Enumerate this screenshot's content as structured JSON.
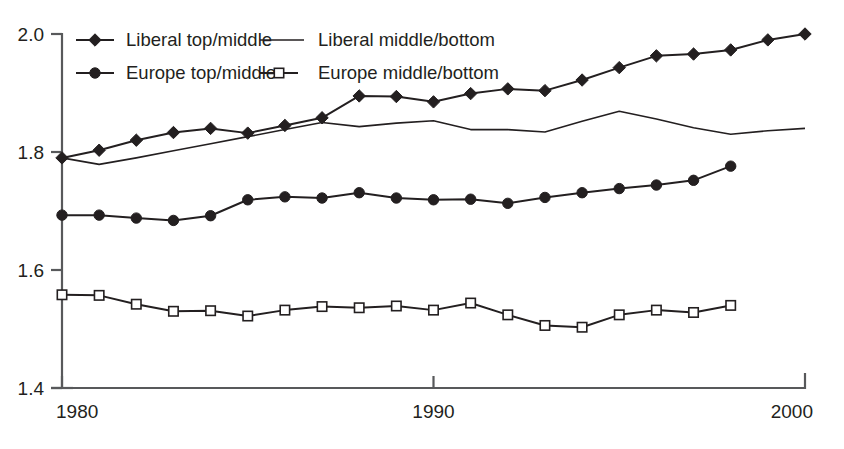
{
  "chart_data": {
    "type": "line",
    "title": "",
    "subtitle": "",
    "xlabel": "",
    "ylabel": "",
    "xlim": [
      1980,
      2000
    ],
    "ylim": [
      1.4,
      2.0
    ],
    "xticks": [
      1980,
      1990,
      2000
    ],
    "xticklabels": [
      "1980",
      "1990",
      "2000"
    ],
    "yticks": [
      1.4,
      1.6,
      1.8,
      2.0
    ],
    "yticklabels": [
      "1.4",
      "1.6",
      "1.8",
      "2.0"
    ],
    "grid": false,
    "legend_position": "top-left",
    "x": [
      1980,
      1981,
      1982,
      1983,
      1984,
      1985,
      1986,
      1987,
      1988,
      1989,
      1990,
      1991,
      1992,
      1993,
      1994,
      1995,
      1996,
      1997,
      1998,
      1999,
      2000
    ],
    "series": [
      {
        "name": "Liberal top/middle",
        "marker": "diamond",
        "line": "solid",
        "color": "#231f20",
        "x": [
          1980,
          1981,
          1982,
          1983,
          1984,
          1985,
          1986,
          1987,
          1988,
          1989,
          1990,
          1991,
          1992,
          1993,
          1994,
          1995,
          1996,
          1997,
          1998,
          1999,
          2000
        ],
        "values": [
          1.79,
          1.803,
          1.82,
          1.833,
          1.84,
          1.832,
          1.845,
          1.858,
          1.895,
          1.894,
          1.885,
          1.899,
          1.907,
          1.904,
          1.922,
          1.943,
          1.963,
          1.966,
          1.973,
          1.99,
          2.0
        ]
      },
      {
        "name": "Liberal middle/bottom",
        "marker": "none",
        "line": "solid",
        "color": "#231f20",
        "x": [
          1980,
          1981,
          1982,
          1983,
          1984,
          1985,
          1986,
          1987,
          1988,
          1989,
          1990,
          1991,
          1992,
          1993,
          1994,
          1995,
          1996,
          1997,
          1998,
          1999,
          2000
        ],
        "values": [
          1.79,
          1.779,
          1.79,
          1.802,
          1.814,
          1.826,
          1.838,
          1.85,
          1.843,
          1.849,
          1.853,
          1.838,
          1.838,
          1.834,
          1.852,
          1.869,
          1.856,
          1.841,
          1.83,
          1.836,
          1.84
        ]
      },
      {
        "name": "Europe top/middle",
        "marker": "circle",
        "line": "solid",
        "color": "#231f20",
        "x": [
          1980,
          1981,
          1982,
          1983,
          1984,
          1985,
          1986,
          1987,
          1988,
          1989,
          1990,
          1991,
          1992,
          1993,
          1994,
          1995,
          1996,
          1997,
          1998
        ],
        "values": [
          1.693,
          1.693,
          1.688,
          1.684,
          1.692,
          1.719,
          1.724,
          1.722,
          1.731,
          1.722,
          1.719,
          1.72,
          1.713,
          1.723,
          1.731,
          1.738,
          1.744,
          1.752,
          1.776
        ]
      },
      {
        "name": "Europe middle/bottom",
        "marker": "square",
        "line": "solid",
        "color": "#231f20",
        "x": [
          1980,
          1981,
          1982,
          1983,
          1984,
          1985,
          1986,
          1987,
          1988,
          1989,
          1990,
          1991,
          1992,
          1993,
          1994,
          1995,
          1996,
          1997,
          1998
        ],
        "values": [
          1.558,
          1.557,
          1.542,
          1.53,
          1.531,
          1.522,
          1.532,
          1.538,
          1.536,
          1.539,
          1.532,
          1.544,
          1.524,
          1.506,
          1.503,
          1.524,
          1.532,
          1.528,
          1.54
        ]
      }
    ],
    "legend": [
      {
        "label": "Liberal top/middle",
        "marker": "diamond"
      },
      {
        "label": "Liberal middle/bottom",
        "marker": "none"
      },
      {
        "label": "Europe top/middle",
        "marker": "circle"
      },
      {
        "label": "Europe middle/bottom",
        "marker": "square"
      }
    ]
  }
}
